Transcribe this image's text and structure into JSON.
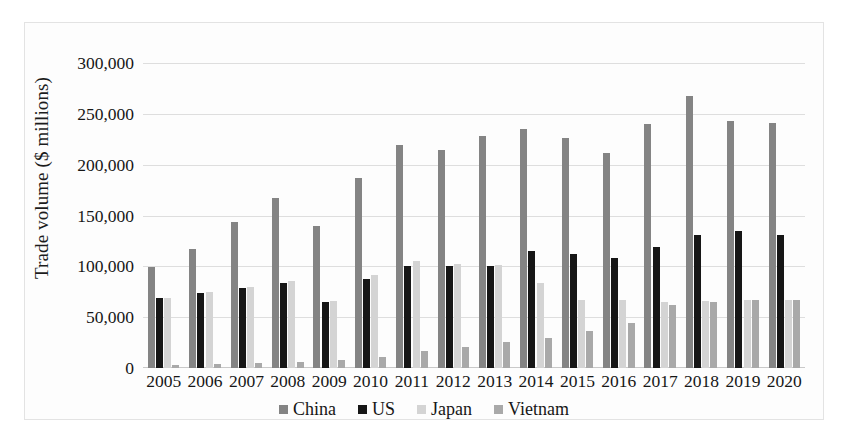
{
  "chart_data": {
    "type": "bar",
    "title": "",
    "subtitle": "",
    "xlabel": "",
    "ylabel": "Trade volume ($ millions)",
    "ylim": [
      0,
      300000
    ],
    "ytick_labels": [
      "300,000",
      "250,000",
      "200,000",
      "150,000",
      "100,000",
      "50,000",
      "0"
    ],
    "ytick_values": [
      300000,
      250000,
      200000,
      150000,
      100000,
      50000,
      0
    ],
    "grid": true,
    "legend_position": "bottom",
    "categories": [
      "2005",
      "2006",
      "2007",
      "2008",
      "2009",
      "2010",
      "2011",
      "2012",
      "2013",
      "2014",
      "2015",
      "2016",
      "2017",
      "2018",
      "2019",
      "2020"
    ],
    "series": [
      {
        "name": "China",
        "color": "#848484",
        "values": [
          99000,
          117000,
          144000,
          167000,
          140000,
          187000,
          219000,
          214000,
          228000,
          235000,
          226000,
          211000,
          240000,
          268000,
          243000,
          241000
        ]
      },
      {
        "name": "US",
        "color": "#161616",
        "values": [
          69000,
          74000,
          79000,
          84000,
          65000,
          88000,
          100000,
          100000,
          100000,
          115000,
          112000,
          108000,
          119000,
          131000,
          135000,
          131000
        ]
      },
      {
        "name": "Japan",
        "color": "#d4d4d4",
        "values": [
          69000,
          75000,
          80000,
          86000,
          66000,
          91000,
          105000,
          102000,
          101000,
          84000,
          67000,
          67000,
          65000,
          66000,
          67000,
          67000
        ]
      },
      {
        "name": "Vietnam",
        "color": "#a9a9a9",
        "values": [
          3000,
          3500,
          4500,
          6000,
          7500,
          11000,
          17000,
          21000,
          26000,
          30000,
          36000,
          44000,
          62000,
          65000,
          67000,
          67000
        ]
      }
    ]
  }
}
